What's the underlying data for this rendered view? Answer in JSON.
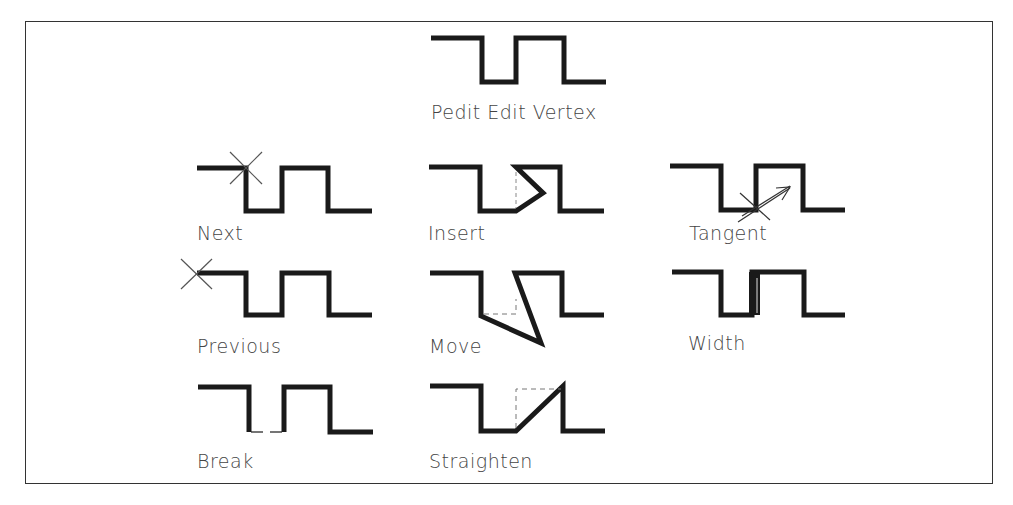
{
  "title": "Pedit Edit Vertex",
  "colors": {
    "line": "#1a1a1a",
    "text": "#444444",
    "frame": "#333333",
    "marker": "#555555"
  },
  "panels": [
    {
      "id": "header",
      "label": "Pedit Edit Vertex",
      "variant": "base"
    },
    {
      "id": "next",
      "label": "Next",
      "variant": "next",
      "marker": "x-cross-at-vertex-2"
    },
    {
      "id": "insert",
      "label": "Insert",
      "variant": "insert",
      "marker": "dashed-guide"
    },
    {
      "id": "tangent",
      "label": "Tangent",
      "variant": "tangent",
      "marker": "tangent-arrow"
    },
    {
      "id": "previous",
      "label": "Previous",
      "variant": "previous",
      "marker": "x-cross-at-vertex-1"
    },
    {
      "id": "move",
      "label": "Move",
      "variant": "move",
      "marker": "dashed-original"
    },
    {
      "id": "width",
      "label": "Width",
      "variant": "width",
      "marker": "thick-segment"
    },
    {
      "id": "break",
      "label": "Break",
      "variant": "break",
      "marker": "thin-gap"
    },
    {
      "id": "straighten",
      "label": "Straighten",
      "variant": "straighten",
      "marker": "dashed-box"
    }
  ]
}
